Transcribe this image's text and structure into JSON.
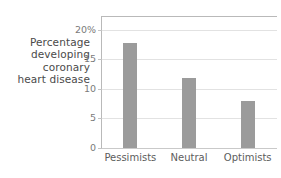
{
  "chart_data": {
    "type": "bar",
    "title": "",
    "subtitle": "",
    "xlabel": "",
    "ylabel": "Percentage developing coronary heart disease",
    "ylabel_lines": [
      "Percentage",
      "developing",
      "coronary",
      "heart disease"
    ],
    "categories": [
      "Pessimists",
      "Neutral",
      "Optimists"
    ],
    "values": [
      17.8,
      11.9,
      8.0
    ],
    "series": [
      {
        "name": "Percentage developing coronary heart disease",
        "values": [
          17.8,
          11.9,
          8.0
        ]
      }
    ],
    "ylim": [
      0,
      22.5
    ],
    "yticks": [
      0,
      5,
      10,
      15,
      20
    ],
    "ytick_labels": [
      "0",
      "5",
      "10",
      "15",
      "20%"
    ],
    "grid": true,
    "legend": false,
    "legend_position": "none",
    "bar_color": "#9b9b9b",
    "gridline_color": "#e2e2e2",
    "frame_color": "#b9b9b9",
    "text_color": "#6d6d6d",
    "background": "#ffffff"
  },
  "axis": {
    "y_label_block": {
      "line1": "Percentage",
      "line2": "developing",
      "line3": "coronary",
      "line4": "heart disease"
    },
    "ytick_0": "0",
    "ytick_5": "5",
    "ytick_10": "10",
    "ytick_15": "15",
    "ytick_20": "20%",
    "xtick_0": "Pessimists",
    "xtick_1": "Neutral",
    "xtick_2": "Optimists"
  }
}
